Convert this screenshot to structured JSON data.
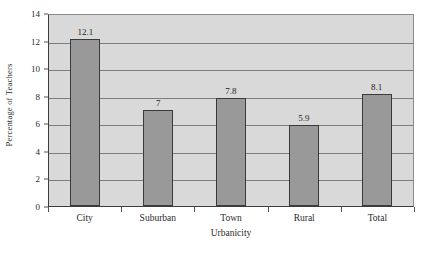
{
  "chart_data": {
    "type": "bar",
    "title": "",
    "categories": [
      "City",
      "Suburban",
      "Town",
      "Rural",
      "Total"
    ],
    "values": [
      12.1,
      7,
      7.8,
      5.9,
      8.1
    ],
    "value_labels": [
      "12.1",
      "7",
      "7.8",
      "5.9",
      "8.1"
    ],
    "xlabel": "Urbanicity",
    "ylabel": "Percentage of Teachers",
    "ylim": [
      0,
      14
    ],
    "ytick_values": [
      0,
      2,
      4,
      6,
      8,
      10,
      12,
      14
    ],
    "ytick_labels": [
      "0",
      "2",
      "4",
      "6",
      "8",
      "10",
      "12",
      "14"
    ],
    "grid": true,
    "grid_axis": "y",
    "legend": false,
    "legend_position": "none",
    "colors": {
      "bar_fill": "#999999",
      "bar_outline": "#3a3a3a",
      "plot_background": "#d9d9d9",
      "gridline": "#7d7d7d",
      "axis_line": "#3d3d3d",
      "text": "#2b2b2b",
      "figure_background": "#ffffff"
    }
  },
  "caption_remnant": ""
}
